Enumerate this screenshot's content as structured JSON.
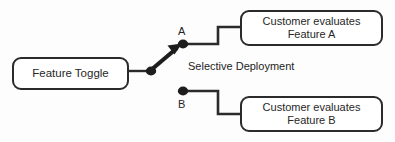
{
  "diagram": {
    "background_color": "#fdfdfd",
    "stroke_color": "#2b2b2b",
    "text_color": "#272727"
  },
  "nodes": {
    "feature_toggle": {
      "label": "Feature Toggle"
    },
    "customer_a": {
      "line1": "Customer evaluates",
      "line2": "Feature A"
    },
    "customer_b": {
      "line1": "Customer evaluates",
      "line2": "Feature B"
    }
  },
  "branches": {
    "a": {
      "label": "A"
    },
    "b": {
      "label": "B"
    }
  },
  "annotations": {
    "selective_deployment": "Selective Deployment"
  }
}
